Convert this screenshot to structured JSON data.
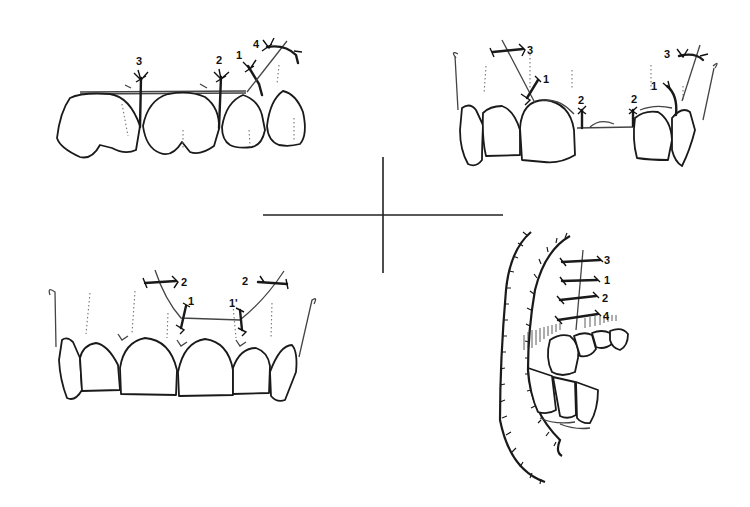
{
  "figure": {
    "divider": {
      "type": "crosshair",
      "center": [
        382,
        215
      ]
    }
  },
  "panels": [
    {
      "id": "top-left",
      "title": "Upper teeth frontal view with vertical sutures",
      "labels": [
        "3",
        "2",
        "1",
        "4"
      ],
      "label_3": "3",
      "label_2": "2",
      "label_1": "1",
      "label_4": "4"
    },
    {
      "id": "top-right",
      "title": "Anterior teeth with gap and suture ties",
      "labels": [
        "3",
        "1",
        "2",
        "2",
        "1",
        "3"
      ],
      "label_3a": "3",
      "label_1a": "1",
      "label_2a": "2",
      "label_2b": "2",
      "label_1b": "1",
      "label_3b": "3"
    },
    {
      "id": "bottom-left",
      "title": "Anterior maxillary teeth with sling sutures",
      "labels": [
        "2",
        "1",
        "1'",
        "2"
      ],
      "label_2a": "2",
      "label_1a": "1",
      "label_1b": "1'",
      "label_2b": "2"
    },
    {
      "id": "bottom-right",
      "title": "Lateral view with ladder sutures on palate",
      "labels": [
        "3",
        "1",
        "2",
        "4"
      ],
      "label_3": "3",
      "label_1": "1",
      "label_2": "2",
      "label_4": "4"
    }
  ]
}
